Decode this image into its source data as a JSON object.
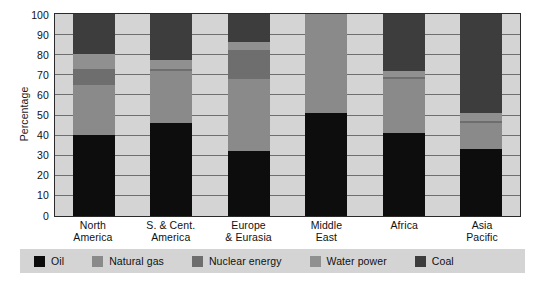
{
  "chart_data": {
    "type": "bar",
    "subtype": "stacked-bar-100-percent",
    "title": "",
    "xlabel": "",
    "ylabel": "Percentage",
    "ylim": [
      0,
      100
    ],
    "ytick_values": [
      0,
      10,
      20,
      30,
      40,
      50,
      60,
      70,
      80,
      90,
      100
    ],
    "ytick_labels": [
      "0",
      "10",
      "20",
      "30",
      "40",
      "50",
      "60",
      "70",
      "80",
      "90",
      "100"
    ],
    "grid": true,
    "legend_position": "bottom",
    "categories": [
      "North\nAmerica",
      "S. & Cent.\nAmerica",
      "Europe\n& Eurasia",
      "Middle\nEast",
      "Africa",
      "Asia\nPacific"
    ],
    "category_lines": [
      [
        "North",
        "America"
      ],
      [
        "S. & Cent.",
        "America"
      ],
      [
        "Europe",
        "& Eurasia"
      ],
      [
        "Middle",
        "East"
      ],
      [
        "Africa",
        ""
      ],
      [
        "Asia",
        "Pacific"
      ]
    ],
    "series": [
      {
        "name": "Oil",
        "color": "#0d0d0d",
        "values": [
          40,
          46,
          32,
          51,
          41,
          33
        ]
      },
      {
        "name": "Natural gas",
        "color": "#8a8a8a",
        "values": [
          25,
          26,
          36,
          49,
          27,
          13
        ]
      },
      {
        "name": "Nuclear energy",
        "color": "#6e6e6e",
        "values": [
          8,
          1,
          14,
          0,
          1,
          1
        ]
      },
      {
        "name": "Water power",
        "color": "#909090",
        "values": [
          7,
          4,
          4,
          0,
          3,
          4
        ]
      },
      {
        "name": "Coal",
        "color": "#3d3d3d",
        "values": [
          20,
          23,
          14,
          0,
          28,
          49
        ]
      }
    ],
    "plot_background": "#d4d4d4",
    "gridline_color": "#6f6f6f",
    "axis_color": "#2b2b2b",
    "legend_background": "#d4d4d4"
  }
}
